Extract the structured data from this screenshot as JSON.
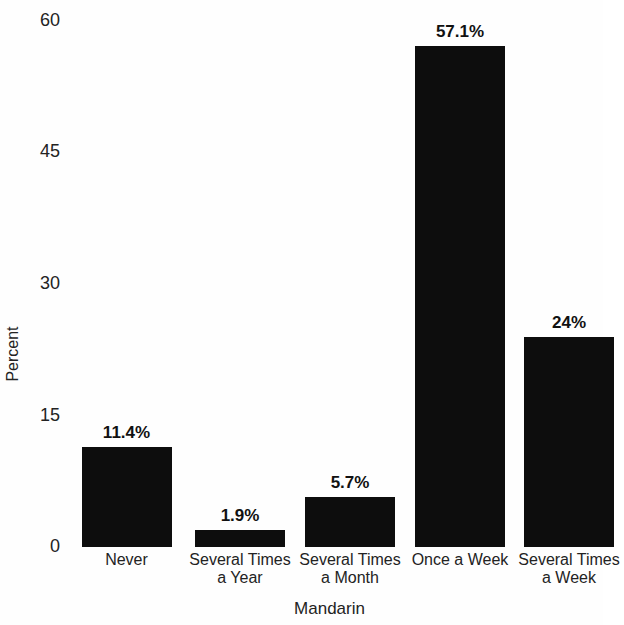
{
  "chart_data": {
    "type": "bar",
    "title": "",
    "subtitle": "",
    "xlabel": "Mandarin",
    "ylabel": "Percent",
    "categories": [
      "Never",
      "Several Times\na Year",
      "Several Times\na Month",
      "Once a Week",
      "Several Times\na Week"
    ],
    "category_lines": [
      [
        "Never"
      ],
      [
        "Several Times",
        "a Year"
      ],
      [
        "Several Times",
        "a Month"
      ],
      [
        "Once a Week"
      ],
      [
        "Several Times",
        "a Week"
      ]
    ],
    "values": [
      11.4,
      1.9,
      5.7,
      57.1,
      24
    ],
    "data_labels": [
      "11.4%",
      "1.9%",
      "5.7%",
      "57.1%",
      "24%"
    ],
    "ylim": [
      0,
      60
    ],
    "yticks": [
      0,
      15,
      30,
      45,
      60
    ],
    "ytick_labels": [
      "0",
      "15",
      "30",
      "45",
      "60"
    ],
    "grid": false,
    "legend": "none",
    "bar_color": "#0d0d0d",
    "background_color": "#fefefe",
    "text_color": "#232323"
  },
  "y_ticks": [
    {
      "label": "60",
      "value": 60
    },
    {
      "label": "45",
      "value": 45
    },
    {
      "label": "30",
      "value": 30
    },
    {
      "label": "15",
      "value": 15
    },
    {
      "label": "0",
      "value": 0
    }
  ],
  "bars": [
    {
      "label_line1": "Never",
      "label_line2": "",
      "value_label": "11.4%",
      "value": 11.4
    },
    {
      "label_line1": "Several Times",
      "label_line2": "a Year",
      "value_label": "1.9%",
      "value": 1.9
    },
    {
      "label_line1": "Several Times",
      "label_line2": "a Month",
      "value_label": "5.7%",
      "value": 5.7
    },
    {
      "label_line1": "Once a Week",
      "label_line2": "",
      "value_label": "57.1%",
      "value": 57.1
    },
    {
      "label_line1": "Several Times",
      "label_line2": "a Week",
      "value_label": "24%",
      "value": 24
    }
  ],
  "axis_titles": {
    "y": "Percent",
    "x": "Mandarin"
  }
}
